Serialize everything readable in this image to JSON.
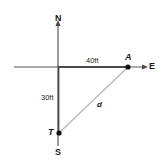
{
  "figure": {
    "type": "geometry-diagram",
    "background_color": "#ffffff",
    "axis_color": "#555555",
    "hypotenuse_color": "#b3b3b3",
    "point_color": "#111111",
    "text_color": "#1a1a1a"
  },
  "axes": {
    "vertical": {
      "name": "north-south-axis",
      "top_label": "N",
      "bottom_label": "S",
      "x": 58,
      "y_top": 22,
      "y_bottom": 146,
      "arrow_at": "top"
    },
    "horizontal": {
      "name": "east-axis",
      "right_label": "E",
      "x_left": 14,
      "x_right": 146,
      "y": 67,
      "arrow_at": "right"
    },
    "origin": {
      "x": 58,
      "y": 67
    }
  },
  "points": [
    {
      "id": "A",
      "label": "A",
      "x": 128,
      "y": 67,
      "label_dx": -3,
      "label_dy": -14
    },
    {
      "id": "T",
      "label": "T",
      "x": 59,
      "y": 133,
      "label_dx": -11,
      "label_dy": -5
    }
  ],
  "segments": [
    {
      "id": "horizontal-leg",
      "from": "origin",
      "to": "A",
      "label": "40ft",
      "label_text": "40ft",
      "style": "solid-dark"
    },
    {
      "id": "vertical-leg",
      "from": "origin",
      "to": "T",
      "label": "30ft",
      "label_text": "30ft",
      "style": "solid-dark"
    },
    {
      "id": "hypotenuse",
      "from": "T",
      "to": "A",
      "label": "d",
      "label_text": "d",
      "style": "solid-light"
    }
  ],
  "labels": {
    "north": "N",
    "south": "S",
    "east": "E",
    "point_a": "A",
    "point_t": "T",
    "horizontal_distance": "40ft",
    "vertical_distance": "30ft",
    "hypotenuse": "d"
  }
}
